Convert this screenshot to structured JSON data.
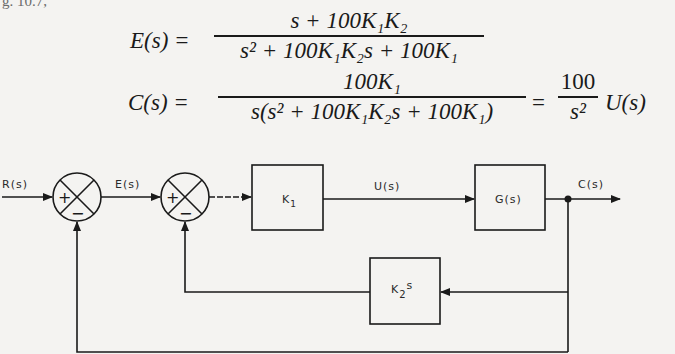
{
  "header_fragment": "g. 10.7,",
  "equations": {
    "E": {
      "lhs": "E(s) =",
      "numerator": "s + 100K₁K₂",
      "denominator": "s² + 100K₁K₂s + 100K₁"
    },
    "C": {
      "lhs": "C(s) =",
      "numerator": "100K₁",
      "denominator": "s(s² + 100K₁K₂s + 100K₁)",
      "equals": "=",
      "rhs_numerator": "100",
      "rhs_denominator": "s²",
      "rhs_factor": "U(s)"
    }
  },
  "diagram": {
    "signals": {
      "input": "R(s)",
      "error": "E(s)",
      "control": "U(s)",
      "output": "C(s)"
    },
    "summing_junctions": [
      {
        "id": "sum1",
        "signs": {
          "left": "+",
          "bottom": "−"
        }
      },
      {
        "id": "sum2",
        "signs": {
          "left": "+",
          "bottom": "−"
        }
      }
    ],
    "blocks": {
      "k1": {
        "label": "K",
        "sub": "1"
      },
      "plant": {
        "label": "G(s)"
      },
      "k2s": {
        "label": "K",
        "sub": "2",
        "suffix": "s"
      }
    }
  }
}
